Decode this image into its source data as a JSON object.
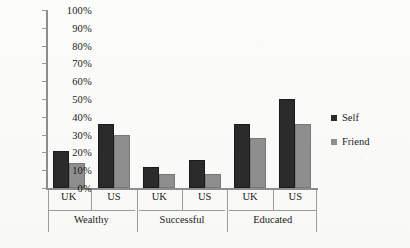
{
  "chart_data": {
    "type": "bar",
    "title": "",
    "subtitle": "",
    "xlabel": "",
    "ylabel": "",
    "ylim": [
      0,
      100
    ],
    "y_tick_labels": [
      "100%",
      "90%",
      "80%",
      "70%",
      "60%",
      "50%",
      "40%",
      "30%",
      "20%",
      "10%",
      "0%"
    ],
    "y_tick_values": [
      100,
      90,
      80,
      70,
      60,
      50,
      40,
      30,
      20,
      10,
      0
    ],
    "grid": false,
    "legend_position": "right",
    "categories": [
      "UK",
      "US",
      "UK",
      "US",
      "UK",
      "US"
    ],
    "groups": [
      {
        "name": "Wealthy",
        "categories": [
          "UK",
          "US"
        ]
      },
      {
        "name": "Successful",
        "categories": [
          "UK",
          "US"
        ]
      },
      {
        "name": "Educated",
        "categories": [
          "UK",
          "US"
        ]
      }
    ],
    "series": [
      {
        "name": "Self",
        "color": "#2b2b2b",
        "values": [
          21,
          36,
          12,
          16,
          36,
          50
        ]
      },
      {
        "name": "Friend",
        "color": "#8e8e8e",
        "values": [
          14,
          30,
          8,
          8,
          28,
          36
        ]
      }
    ]
  },
  "legend": {
    "items": [
      {
        "label": "Self",
        "swatch": "self"
      },
      {
        "label": "Friend",
        "swatch": "friend"
      }
    ]
  },
  "colors": {
    "self": "#2b2b2b",
    "friend": "#8e8e8e",
    "axis": "#8d8d8d",
    "background": "#fbfbfa",
    "text": "#1a1a1a"
  }
}
